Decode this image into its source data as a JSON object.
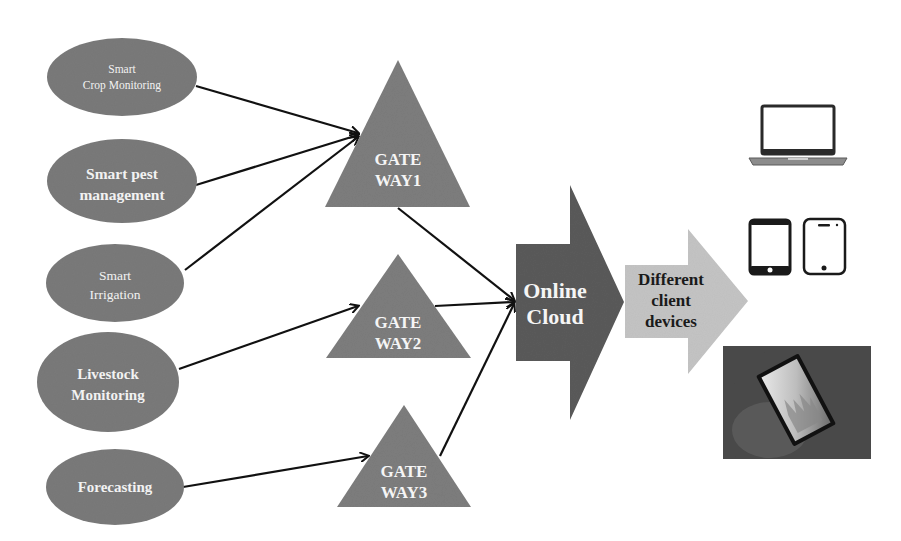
{
  "diagram": {
    "colors": {
      "node_fill": "#7a7a7a",
      "gateway_fill": "#7d7d7d",
      "cloud_fill": "#5a5a5a",
      "client_arrow_fill": "#c4c4c4",
      "connector": "#111111",
      "background": "#ffffff"
    },
    "sources": [
      {
        "id": "crop",
        "line1": "Smart",
        "line2": "Crop Monitoring",
        "target": "gateway1"
      },
      {
        "id": "pest",
        "line1": "Smart pest",
        "line2": "management",
        "target": "gateway1"
      },
      {
        "id": "irrigation",
        "line1": "Smart",
        "line2": "Irrigation",
        "target": "gateway1"
      },
      {
        "id": "livestock",
        "line1": "Livestock",
        "line2": "Monitoring",
        "target": "gateway2"
      },
      {
        "id": "forecasting",
        "line1": "Forecasting",
        "line2": "",
        "target": "gateway3"
      }
    ],
    "gateways": [
      {
        "id": "gateway1",
        "line1": "GATE",
        "line2": "WAY1"
      },
      {
        "id": "gateway2",
        "line1": "GATE",
        "line2": "WAY2"
      },
      {
        "id": "gateway3",
        "line1": "GATE",
        "line2": "WAY3"
      }
    ],
    "cloud": {
      "line1": "Online",
      "line2": "Cloud"
    },
    "client": {
      "line1": "Different",
      "line2": "client",
      "line3": "devices"
    },
    "devices": [
      {
        "id": "laptop",
        "icon": "laptop-icon"
      },
      {
        "id": "phone",
        "icon": "smartphone-icon"
      },
      {
        "id": "tablet",
        "icon": "tablet-icon"
      },
      {
        "id": "tablet-photo",
        "icon": "tablet-in-hand-photo"
      }
    ]
  }
}
